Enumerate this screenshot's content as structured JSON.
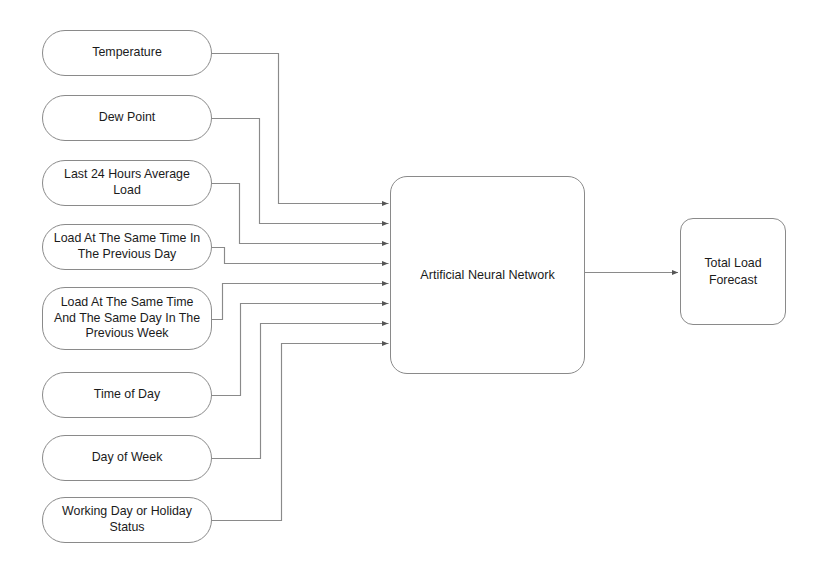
{
  "diagram": {
    "line_color": "#8a8a8a",
    "text_color": "#1b1b1b",
    "background_color": "#ffffff",
    "inputs": [
      {
        "id": "temperature",
        "label": "Temperature",
        "x": 42,
        "y": 30,
        "w": 170,
        "h": 46,
        "elbow_x": 278,
        "arrow_y": 203
      },
      {
        "id": "dew-point",
        "label": "Dew Point",
        "x": 42,
        "y": 95,
        "w": 170,
        "h": 46,
        "elbow_x": 259,
        "arrow_y": 223
      },
      {
        "id": "last-24-hours-average-load",
        "label": "Last 24 Hours Average\nLoad",
        "x": 42,
        "y": 160,
        "w": 170,
        "h": 46,
        "elbow_x": 239,
        "arrow_y": 243
      },
      {
        "id": "load-same-time-previous-day",
        "label": "Load At The Same Time In\nThe Previous Day",
        "x": 42,
        "y": 224,
        "w": 170,
        "h": 46,
        "elbow_x": 224,
        "arrow_y": 263
      },
      {
        "id": "load-same-time-same-day-previous-week",
        "label": "Load At The Same Time\nAnd The Same Day In The\nPrevious Week",
        "x": 42,
        "y": 287,
        "w": 170,
        "h": 63,
        "elbow_x": 222,
        "arrow_y": 283
      },
      {
        "id": "time-of-day",
        "label": "Time of Day",
        "x": 42,
        "y": 372,
        "w": 170,
        "h": 46,
        "elbow_x": 240,
        "arrow_y": 303
      },
      {
        "id": "day-of-week",
        "label": "Day of Week",
        "x": 42,
        "y": 435,
        "w": 170,
        "h": 46,
        "elbow_x": 260,
        "arrow_y": 323
      },
      {
        "id": "working-day-or-holiday-status",
        "label": "Working Day or Holiday\nStatus",
        "x": 42,
        "y": 497,
        "w": 170,
        "h": 46,
        "elbow_x": 281,
        "arrow_y": 343
      }
    ],
    "core": {
      "id": "artificial-neural-network",
      "label": "Artificial Neural Network",
      "x": 390,
      "y": 176,
      "w": 195,
      "h": 198
    },
    "output": {
      "id": "total-load-forecast",
      "label": "Total Load\nForecast",
      "x": 680,
      "y": 218,
      "w": 106,
      "h": 107
    },
    "core_to_output_arrow": {
      "from_x": 585,
      "to_x": 678,
      "y": 272
    }
  }
}
